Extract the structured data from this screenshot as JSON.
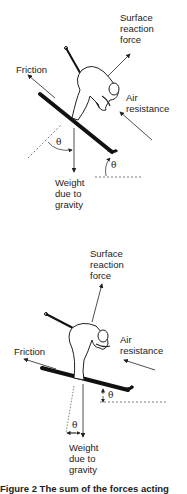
{
  "figure_top": {
    "labels": {
      "surface_reaction": "Surface\nreaction\nforce",
      "friction": "Friction",
      "air_resistance": "Air\nresistance",
      "weight": "Weight\ndue to\ngravity"
    },
    "angle_symbol": "θ"
  },
  "figure_bottom": {
    "labels": {
      "surface_reaction": "Surface\nreaction\nforce",
      "friction": "Friction",
      "air_resistance": "Air\nresistance",
      "weight": "Weight\ndue to\ngravity"
    },
    "angle_symbol": "θ"
  },
  "caption": "Figure 2    The sum of the forces acting"
}
